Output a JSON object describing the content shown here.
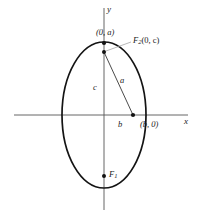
{
  "figure": {
    "axes": {
      "x_label": "x",
      "y_label": "y"
    },
    "colors": {
      "curve": "#1a1a1a",
      "axis": "#4d4d4d",
      "leader": "#8a8a8a",
      "text": "#1a1a1a",
      "background": "#ffffff"
    },
    "labels": {
      "vertex_top": "(0, a)",
      "focus_upper": "F2(0, c)",
      "focus_upper_base": "F",
      "focus_upper_sub": "2",
      "focus_upper_coords": "(0, c)",
      "focus_lower_base": "F",
      "focus_lower_sub": "1",
      "vertex_right": "(b, 0)",
      "segment_a": "a",
      "segment_c": "c",
      "segment_b": "b"
    },
    "geometry": {
      "center": [
        104,
        115
      ],
      "semi_major_y": 73,
      "semi_minor_x": 42,
      "vertex_top_point": [
        104,
        43
      ],
      "vertex_right_point": [
        133,
        115
      ],
      "focus_upper_point": [
        104,
        52
      ],
      "focus_lower_point": [
        104,
        176
      ],
      "x_axis": [
        14,
        115,
        188,
        115
      ],
      "y_axis": [
        104,
        8,
        104,
        210
      ]
    }
  }
}
